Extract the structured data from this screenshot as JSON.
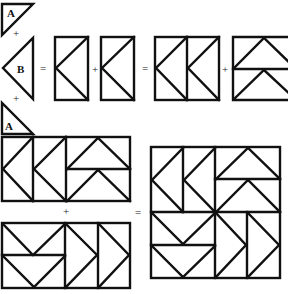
{
  "diagram": {
    "pieces": {
      "triangle_a_top": {
        "label": "A"
      },
      "triangle_b": {
        "label": "B"
      },
      "triangle_a_bottom": {
        "label": "A"
      }
    },
    "operators": {
      "plus_1": "+",
      "plus_2": "+",
      "equals_1": "=",
      "plus_3": "+",
      "equals_2": "=",
      "plus_4": "+",
      "plus_5": "+",
      "equals_3": "="
    },
    "steps": [
      {
        "name": "A + B + A = flying-geese unit (rectangle)"
      },
      {
        "name": "unit + unit = two-unit square"
      },
      {
        "name": "two-unit square + geese square = half block"
      },
      {
        "name": "half block + half block = finished block"
      }
    ],
    "colors": {
      "line": "#111111",
      "background": "#ffffff"
    }
  }
}
